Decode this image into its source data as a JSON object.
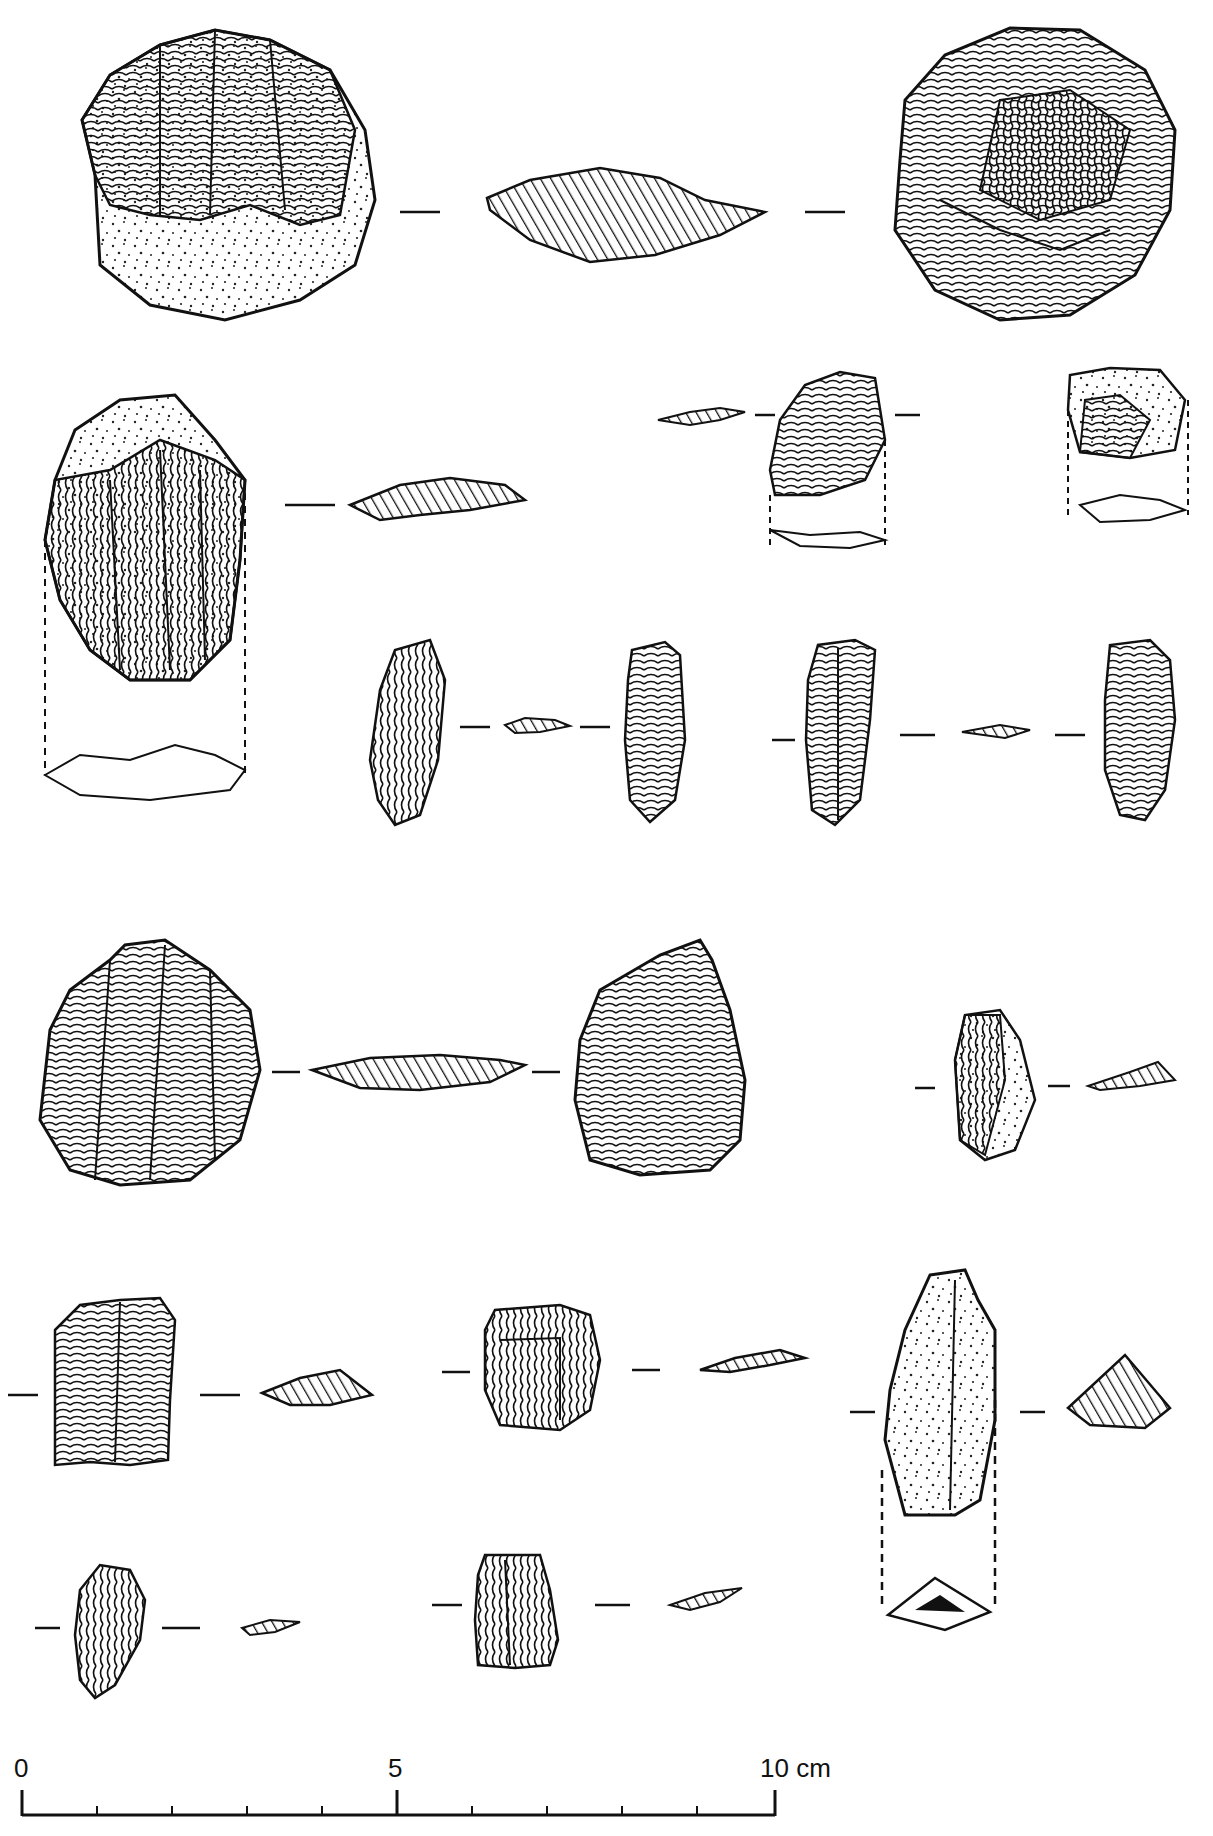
{
  "plate": {
    "type": "archaeological lithic illustration",
    "background": "#ffffff",
    "ink": "#111111",
    "conventions": {
      "flake_scars": "concentric ripple lines",
      "cortex": "stippled dots",
      "cross_section": "diagonal hatching",
      "section_marker": "short dashed tick lines",
      "projection": "dashed vertical lines"
    },
    "rows": [
      {
        "row": 1,
        "items": [
          {
            "id": "a",
            "view": "discoidal core, face 1 (partly cortical)",
            "x": 80,
            "y": 20,
            "w": 295,
            "h": 300
          },
          {
            "id": "a-sec",
            "view": "cross-section",
            "x": 485,
            "y": 170,
            "w": 280,
            "h": 95
          },
          {
            "id": "a2",
            "view": "discoidal core, face 2",
            "x": 885,
            "y": 20,
            "w": 290,
            "h": 310
          }
        ]
      },
      {
        "row": 2,
        "items": [
          {
            "id": "b",
            "view": "cortical flake",
            "x": 40,
            "y": 395,
            "w": 210,
            "h": 290
          },
          {
            "id": "c",
            "view": "small flake",
            "x": 760,
            "y": 370,
            "w": 125,
            "h": 130
          },
          {
            "id": "d",
            "view": "small flake",
            "x": 1065,
            "y": 365,
            "w": 125,
            "h": 90
          }
        ]
      },
      {
        "row": 3,
        "items": [
          {
            "id": "e",
            "view": "bladelet, dorsal/ventral",
            "x": 370,
            "y": 640,
            "w": 320,
            "h": 185
          },
          {
            "id": "f",
            "view": "bladelet, dorsal/ventral",
            "x": 810,
            "y": 640,
            "w": 370,
            "h": 185
          }
        ]
      },
      {
        "row": 4,
        "items": [
          {
            "id": "g",
            "view": "flake, dorsal/ventral",
            "x": 35,
            "y": 935,
            "w": 750,
            "h": 250
          },
          {
            "id": "h",
            "view": "small cortical flake",
            "x": 950,
            "y": 1010,
            "w": 230,
            "h": 150
          }
        ]
      },
      {
        "row": 5,
        "items": [
          {
            "id": "i",
            "view": "flake",
            "x": 45,
            "y": 1290,
            "w": 330,
            "h": 180
          },
          {
            "id": "j",
            "view": "flake",
            "x": 480,
            "y": 1305,
            "w": 325,
            "h": 130
          },
          {
            "id": "k",
            "view": "cortical blade with butt view",
            "x": 885,
            "y": 1270,
            "w": 290,
            "h": 365
          }
        ]
      },
      {
        "row": 6,
        "items": [
          {
            "id": "l",
            "view": "small flake",
            "x": 40,
            "y": 1560,
            "w": 260,
            "h": 135
          },
          {
            "id": "m",
            "view": "small flake",
            "x": 470,
            "y": 1560,
            "w": 280,
            "h": 120
          }
        ]
      }
    ]
  },
  "scale_bar": {
    "unit": "cm",
    "labels": {
      "start": "0",
      "mid": "5",
      "end": "10 cm"
    },
    "ticks": 10,
    "x_start": 22,
    "x_end": 775,
    "y": 1815
  }
}
